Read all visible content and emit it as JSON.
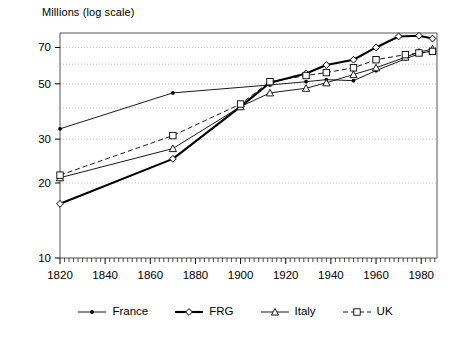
{
  "chart_data": {
    "type": "line",
    "title": "Millions (log scale)",
    "xlabel": "",
    "ylabel": "Millions (log scale)",
    "yscale": "log",
    "ylim": [
      10,
      80
    ],
    "xlim": [
      1820,
      1987
    ],
    "ytick_labels": [
      "10",
      "20",
      "30",
      "50",
      "70"
    ],
    "ytick_values": [
      10,
      20,
      30,
      50,
      70
    ],
    "xtick_labels": [
      "1820",
      "1840",
      "1860",
      "1880",
      "1900",
      "1920",
      "1940",
      "1960",
      "1980"
    ],
    "xtick_values": [
      1820,
      1840,
      1860,
      1880,
      1900,
      1920,
      1940,
      1960,
      1980
    ],
    "grid": true,
    "grid_style": "dotted-horizontal",
    "legend_position": "bottom",
    "series": [
      {
        "name": "France",
        "marker": "filled-circle",
        "linestyle": "solid",
        "linewidth": "thin",
        "color": "#000000",
        "x": [
          1820,
          1870,
          1913,
          1929,
          1938,
          1950,
          1960,
          1973,
          1979,
          1985
        ],
        "y": [
          33.0,
          46.0,
          49.5,
          51.0,
          52.0,
          51.5,
          56.5,
          63.0,
          66.0,
          68.0
        ]
      },
      {
        "name": "FRG",
        "marker": "diamond",
        "linestyle": "solid",
        "linewidth": "thick",
        "color": "#000000",
        "x": [
          1820,
          1870,
          1900,
          1913,
          1929,
          1938,
          1950,
          1960,
          1970,
          1979,
          1985
        ],
        "y": [
          16.5,
          25.0,
          40.5,
          50.5,
          55.0,
          59.5,
          62.5,
          70.0,
          77.5,
          78.0,
          76.0
        ]
      },
      {
        "name": "Italy",
        "marker": "triangle",
        "linestyle": "solid",
        "linewidth": "thin",
        "color": "#000000",
        "x": [
          1820,
          1870,
          1900,
          1913,
          1929,
          1938,
          1950,
          1960,
          1973,
          1979,
          1985
        ],
        "y": [
          21.0,
          27.5,
          40.5,
          46.0,
          48.0,
          50.5,
          54.5,
          58.0,
          64.0,
          67.0,
          69.0
        ]
      },
      {
        "name": "UK",
        "marker": "square",
        "linestyle": "dashed",
        "linewidth": "thin",
        "color": "#000000",
        "x": [
          1820,
          1870,
          1900,
          1913,
          1929,
          1938,
          1950,
          1960,
          1973,
          1979,
          1985
        ],
        "y": [
          21.5,
          31.0,
          41.5,
          51.0,
          54.0,
          55.5,
          58.0,
          62.5,
          65.5,
          66.5,
          67.5
        ]
      }
    ]
  },
  "legend": {
    "items": [
      {
        "label": "France",
        "marker": "filled-circle"
      },
      {
        "label": "FRG",
        "marker": "diamond"
      },
      {
        "label": "Italy",
        "marker": "triangle"
      },
      {
        "label": "UK",
        "marker": "square"
      }
    ]
  }
}
